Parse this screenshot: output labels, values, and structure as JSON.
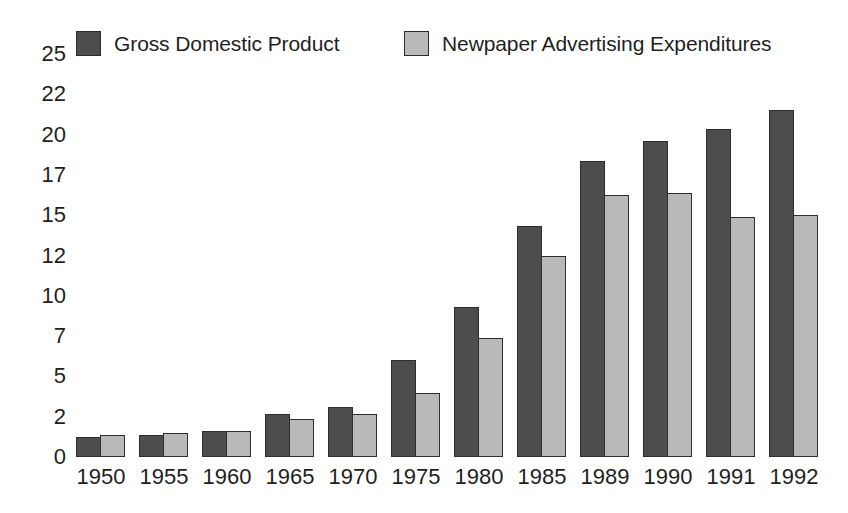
{
  "chart_data": {
    "type": "bar",
    "title": "",
    "subtitle": "",
    "xlabel": "",
    "ylabel": "",
    "grid": false,
    "legend_position": "top",
    "categories": [
      "1950",
      "1955",
      "1960",
      "1965",
      "1970",
      "1975",
      "1980",
      "1985",
      "1989",
      "1990",
      "1991",
      "1992"
    ],
    "y_ticks": [
      0,
      2,
      5,
      7,
      10,
      12,
      15,
      17,
      20,
      22,
      25
    ],
    "y_tick_labels": [
      "0",
      "2",
      "5",
      "7",
      "10",
      "12",
      "15",
      "17",
      "20",
      "22",
      "25"
    ],
    "ylim": [
      0,
      25
    ],
    "series": [
      {
        "name": "Gross Domestic Product",
        "color": "#4d4d4d",
        "values": [
          1.0,
          1.1,
          1.3,
          2.2,
          2.7,
          5.8,
          9.2,
          14.2,
          18.0,
          19.5,
          20.3,
          21.2
        ]
      },
      {
        "name": "Newpaper Advertising Expenditures",
        "color": "#b9b9b9",
        "values": [
          1.1,
          1.2,
          1.3,
          1.9,
          2.2,
          3.8,
          6.9,
          12.0,
          16.0,
          16.1,
          14.9,
          15.0
        ]
      }
    ]
  },
  "legend": {
    "entries": [
      {
        "label": "Gross Domestic Product",
        "swatch": "#4d4d4d"
      },
      {
        "label": "Newpaper Advertising Expenditures",
        "swatch": "#b9b9b9"
      }
    ]
  },
  "colors": {
    "background": "#ffffff",
    "text": "#1f1f1f",
    "series_dark": "#4d4d4d",
    "series_light": "#b9b9b9",
    "bar_outline": "#2e2e2e"
  }
}
